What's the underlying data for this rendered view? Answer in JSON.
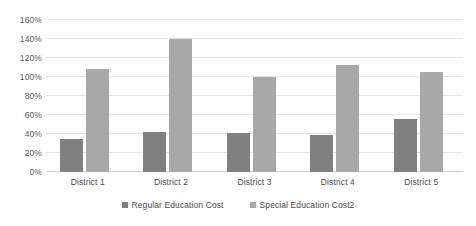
{
  "chart_data": {
    "type": "bar",
    "title": "",
    "xlabel": "",
    "ylabel": "",
    "categories": [
      "District 1",
      "District 2",
      "District 3",
      "District 4",
      "District 5"
    ],
    "series": [
      {
        "name": "Regular Education Cost",
        "color": "#808080",
        "values": [
          35,
          42,
          41,
          39,
          56
        ]
      },
      {
        "name": "Special Education Cost2",
        "color": "#a8a8a8",
        "values": [
          108,
          140,
          100,
          113,
          105
        ]
      }
    ],
    "ylim": [
      0,
      160
    ],
    "ytick_values": [
      0,
      20,
      40,
      60,
      80,
      100,
      120,
      140,
      160
    ],
    "ytick_labels": [
      "0%",
      "20%",
      "40%",
      "60%",
      "80%",
      "100%",
      "120%",
      "140%",
      "160%"
    ],
    "grid": true,
    "grid_axis": "y",
    "legend_position": "bottom",
    "value_suffix": "%"
  },
  "legend": {
    "items": [
      {
        "label": "Regular Education Cost",
        "swatch": "legend-swatch-regular"
      },
      {
        "label": "Special Education Cost2",
        "swatch": "legend-swatch-special"
      }
    ]
  }
}
